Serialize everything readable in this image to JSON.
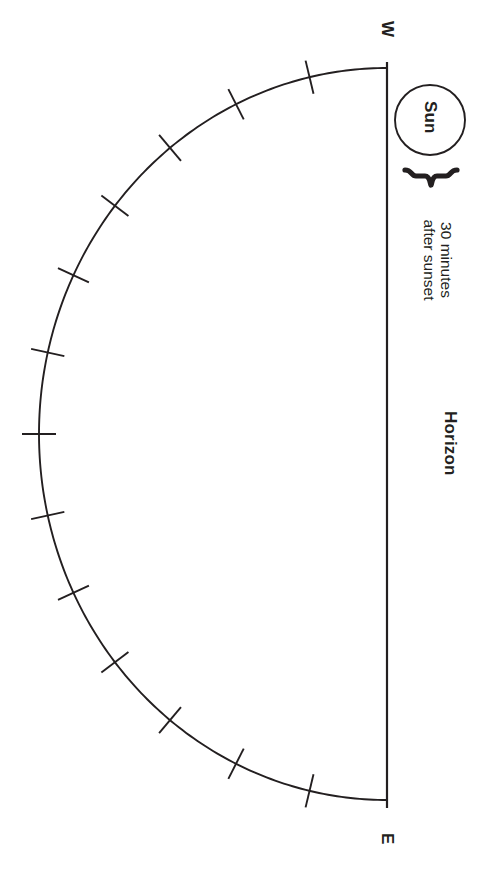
{
  "figure": {
    "stroke_color": "#231f20",
    "background": "#ffffff",
    "labels": {
      "west": "W",
      "east": "E",
      "horizon": "Horizon",
      "sun": "Sun",
      "caption_line1": "30 minutes",
      "caption_line2": "after sunset"
    }
  },
  "chart_data": {
    "type": "diagram",
    "horizon_line": {
      "label": "Horizon",
      "orientation": "vertical",
      "x": 387,
      "y_top": 62,
      "y_bottom": 808,
      "endpoints": [
        "W",
        "E"
      ]
    },
    "arc": {
      "center_x": 387,
      "center_y": 434,
      "radius_x": 348,
      "radius_y": 366,
      "start_angle_deg": -90,
      "end_angle_deg": 90,
      "span_deg": 180
    },
    "ticks": {
      "count": 13,
      "spacing_deg": 12.857,
      "angles_deg": [
        -77.14,
        -64.29,
        -51.43,
        -38.57,
        -25.71,
        -12.86,
        0,
        12.86,
        25.71,
        38.57,
        51.43,
        64.29,
        77.14
      ],
      "length_px": 34,
      "orientation": "perpendicular to arc"
    },
    "sun": {
      "label": "Sun",
      "center_x": 430,
      "center_y": 120,
      "radius": 35,
      "filled": false
    },
    "brace": {
      "caption": [
        "30 minutes",
        "after sunset"
      ],
      "points_to": "gap between Sun and horizon endpoint W",
      "x": 414,
      "y_from": 168,
      "y_to": 185
    },
    "cardinal_points": [
      {
        "label": "W",
        "x": 387,
        "y": 30,
        "position": "top"
      },
      {
        "label": "E",
        "x": 387,
        "y": 843,
        "position": "bottom"
      }
    ]
  }
}
